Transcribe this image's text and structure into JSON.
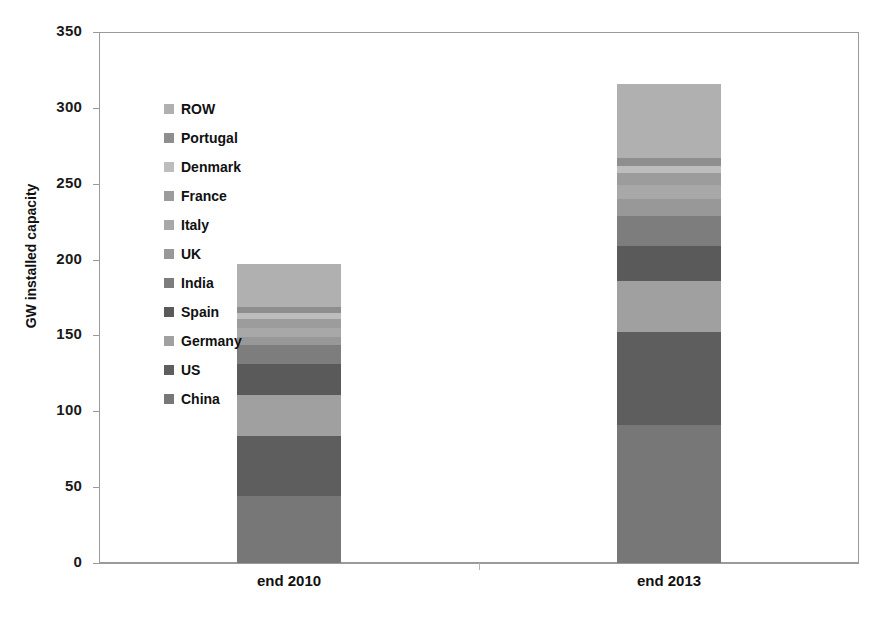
{
  "chart_data": {
    "type": "bar",
    "subtype": "stacked-bar",
    "title": "",
    "xlabel": "",
    "ylabel": "GW installed capacity",
    "ylim": [
      0,
      350
    ],
    "yticks": [
      0,
      50,
      100,
      150,
      200,
      250,
      300,
      350
    ],
    "ytick_labels": [
      "0",
      "50",
      "100",
      "150",
      "200",
      "250",
      "300",
      "350"
    ],
    "grid": false,
    "legend_position": "inside-upper-left",
    "categories": [
      "end 2010",
      "end 2013"
    ],
    "stack_order_bottom_to_top": [
      "China",
      "US",
      "Germany",
      "Spain",
      "India",
      "UK",
      "Italy",
      "France",
      "Denmark",
      "Portugal",
      "ROW"
    ],
    "series": [
      {
        "name": "China",
        "color": "#777777",
        "values": [
          44.0,
          91.0
        ]
      },
      {
        "name": "US",
        "color": "#5e5e5e",
        "values": [
          40.0,
          61.0
        ]
      },
      {
        "name": "Germany",
        "color": "#a0a0a0",
        "values": [
          27.0,
          34.0
        ]
      },
      {
        "name": "Spain",
        "color": "#5a5a5a",
        "values": [
          20.0,
          23.0
        ]
      },
      {
        "name": "India",
        "color": "#7d7d7d",
        "values": [
          13.0,
          20.0
        ]
      },
      {
        "name": "UK",
        "color": "#989898",
        "values": [
          5.0,
          11.0
        ]
      },
      {
        "name": "Italy",
        "color": "#a8a8a8",
        "values": [
          6.0,
          9.0
        ]
      },
      {
        "name": "France",
        "color": "#9c9c9c",
        "values": [
          6.0,
          8.0
        ]
      },
      {
        "name": "Denmark",
        "color": "#bdbdbd",
        "values": [
          4.0,
          5.0
        ]
      },
      {
        "name": "Portugal",
        "color": "#8e8e8e",
        "values": [
          4.0,
          5.0
        ]
      },
      {
        "name": "ROW",
        "color": "#b0b0b0",
        "values": [
          28.0,
          49.0
        ]
      }
    ],
    "totals": [
      197.0,
      316.0
    ]
  },
  "axes": {
    "y_title": "GW installed capacity",
    "y_tick_labels": [
      "350",
      "300",
      "250",
      "200",
      "150",
      "100",
      "50",
      "0"
    ],
    "x_category_labels": [
      "end 2010",
      "end 2013"
    ]
  },
  "legend": {
    "items": [
      {
        "label": "ROW",
        "color": "#b0b0b0"
      },
      {
        "label": "Portugal",
        "color": "#8e8e8e"
      },
      {
        "label": "Denmark",
        "color": "#bdbdbd"
      },
      {
        "label": "France",
        "color": "#9c9c9c"
      },
      {
        "label": "Italy",
        "color": "#a8a8a8"
      },
      {
        "label": "UK",
        "color": "#989898"
      },
      {
        "label": "India",
        "color": "#7d7d7d"
      },
      {
        "label": "Spain",
        "color": "#5a5a5a"
      },
      {
        "label": "Germany",
        "color": "#a0a0a0"
      },
      {
        "label": "US",
        "color": "#5e5e5e"
      },
      {
        "label": "China",
        "color": "#777777"
      }
    ]
  }
}
